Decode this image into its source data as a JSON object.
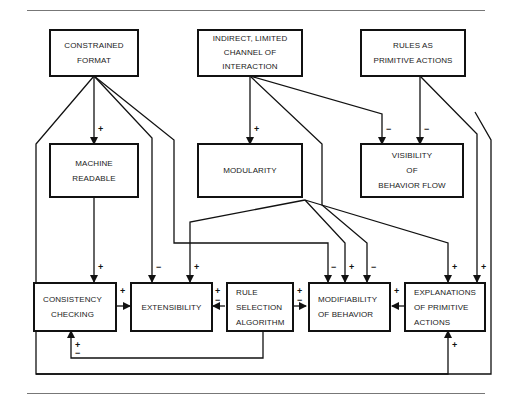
{
  "diagram": {
    "nodes": [
      {
        "id": "constrained_format",
        "lines": [
          "CONSTRAINED",
          "FORMAT"
        ]
      },
      {
        "id": "indirect_channel",
        "lines": [
          "INDIRECT, LIMITED",
          "CHANNEL OF",
          "INTERACTION"
        ]
      },
      {
        "id": "rules_primitive",
        "lines": [
          "RULES AS",
          "PRIMITIVE ACTIONS"
        ]
      },
      {
        "id": "machine_readable",
        "lines": [
          "MACHINE",
          "READABLE"
        ]
      },
      {
        "id": "modularity",
        "lines": [
          "MODULARITY"
        ]
      },
      {
        "id": "visibility",
        "lines": [
          "VISIBILITY",
          "OF",
          "BEHAVIOR FLOW"
        ]
      },
      {
        "id": "consistency",
        "lines": [
          "CONSISTENCY",
          "CHECKING"
        ]
      },
      {
        "id": "extensibility",
        "lines": [
          "EXTENSIBILITY"
        ]
      },
      {
        "id": "rule_selection",
        "lines": [
          "RULE",
          "SELECTION",
          "ALGORITHM"
        ]
      },
      {
        "id": "modifiability",
        "lines": [
          "MODIFIABILITY",
          "OF BEHAVIOR"
        ]
      },
      {
        "id": "explanations",
        "lines": [
          "EXPLANATIONS",
          "OF PRIMITIVE",
          "ACTIONS"
        ]
      }
    ],
    "edges": [
      {
        "from": "constrained_format",
        "to": "machine_readable",
        "sign": "+"
      },
      {
        "from": "constrained_format",
        "to": "extensibility",
        "sign": "−"
      },
      {
        "from": "constrained_format",
        "to": "modifiability",
        "sign": "−"
      },
      {
        "from": "constrained_format",
        "to": "explanations",
        "sign": "+"
      },
      {
        "from": "indirect_channel",
        "to": "modularity",
        "sign": "+"
      },
      {
        "from": "indirect_channel",
        "to": "modifiability",
        "sign": "−"
      },
      {
        "from": "indirect_channel",
        "to": "visibility",
        "sign": "−"
      },
      {
        "from": "rules_primitive",
        "to": "visibility",
        "sign": "−"
      },
      {
        "from": "rules_primitive",
        "to": "explanations",
        "sign": "+"
      },
      {
        "from": "machine_readable",
        "to": "consistency",
        "sign": "+"
      },
      {
        "from": "modularity",
        "to": "extensibility",
        "sign": "+"
      },
      {
        "from": "modularity",
        "to": "modifiability",
        "sign": "+"
      },
      {
        "from": "modularity",
        "to": "explanations",
        "sign": "+"
      },
      {
        "from": "consistency",
        "to": "extensibility",
        "sign": "+"
      },
      {
        "from": "rule_selection",
        "to": "extensibility",
        "sign": "±"
      },
      {
        "from": "rule_selection",
        "to": "modifiability",
        "sign": "±"
      },
      {
        "from": "rule_selection",
        "to": "consistency",
        "sign": "±"
      },
      {
        "from": "explanations",
        "to": "modifiability",
        "sign": "+"
      },
      {
        "from": "rule_selection",
        "to": "explanations",
        "sign": "+"
      }
    ],
    "signs": {
      "plus": "+",
      "minus": "−"
    }
  }
}
